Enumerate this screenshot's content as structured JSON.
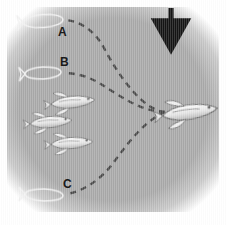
{
  "figure": {
    "name": "fish-trajectory-diagram",
    "background_color": "#a8a8a8",
    "border_color": "#ffffff",
    "canvas": {
      "width": 226,
      "height": 225
    }
  },
  "labels": [
    {
      "id": "A",
      "text": "A",
      "x": 58,
      "y": 26
    },
    {
      "id": "B",
      "text": "B",
      "x": 60,
      "y": 56
    },
    {
      "id": "C",
      "text": "C",
      "x": 63,
      "y": 178
    }
  ],
  "arrow": {
    "name": "stimulus-arrow",
    "direction": "down",
    "color": "#141414",
    "x": 171,
    "y_start": 8,
    "y_end": 42
  },
  "ghost_fish": [
    {
      "id": "ghost-A",
      "label": "A",
      "cx": 43,
      "cy": 21,
      "rx": 20,
      "ry": 6.5,
      "rotation": -4,
      "outline_color": "#f2f2f2"
    },
    {
      "id": "ghost-B",
      "label": "B",
      "cx": 43,
      "cy": 73,
      "rx": 18,
      "ry": 6.0,
      "rotation": -3,
      "outline_color": "#f2f2f2"
    },
    {
      "id": "ghost-C",
      "label": "C",
      "cx": 44,
      "cy": 195,
      "rx": 19,
      "ry": 6.0,
      "rotation": 2,
      "outline_color": "#f2f2f2"
    }
  ],
  "school_fish": [
    {
      "id": "fish-1",
      "cx": 73,
      "cy": 102,
      "scale": 1.0,
      "rotation": -6
    },
    {
      "id": "fish-2",
      "cx": 51,
      "cy": 122,
      "scale": 0.95,
      "rotation": -5
    },
    {
      "id": "fish-3",
      "cx": 72,
      "cy": 143,
      "scale": 0.95,
      "rotation": -4
    }
  ],
  "target_fish": {
    "id": "fish-target",
    "cx": 190,
    "cy": 112,
    "scale": 1.25,
    "rotation": -8
  },
  "trajectories": [
    {
      "id": "path-A",
      "label": "A",
      "dash": "6,5",
      "color": "#4a4a4a",
      "width": 2.4,
      "d": "M 165 112 C 143 110 120 78 104 48 C 96 33 83 22 66 20"
    },
    {
      "id": "path-B",
      "label": "B",
      "dash": "6,5",
      "color": "#4a4a4a",
      "width": 2.4,
      "d": "M 165 112 C 142 112 120 96 104 86 C 92 78 78 73 64 73"
    },
    {
      "id": "path-C",
      "label": "C",
      "dash": "6,5",
      "color": "#4a4a4a",
      "width": 2.4,
      "d": "M 165 112 C 146 120 130 140 114 162 C 101 180 82 192 66 194"
    }
  ],
  "convergence_point": {
    "x": 165,
    "y": 112
  }
}
